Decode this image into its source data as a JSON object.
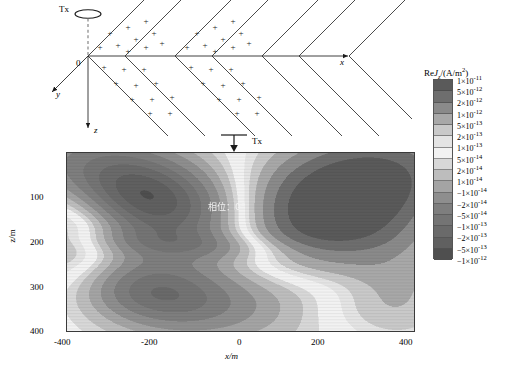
{
  "figure": {
    "schematic": {
      "tx_label": "Tx",
      "origin_label": "0",
      "axis_x": "x",
      "axis_y": "y",
      "axis_z": "z",
      "charge_symbol": "+",
      "n_wavefronts": 4
    },
    "plot": {
      "tx_marker_label": "Tx",
      "annotation": "相位：0°",
      "xlabel": "x/m",
      "ylabel": "z/m",
      "xticks": [
        "-400",
        "-200",
        "0",
        "200",
        "400"
      ],
      "yticks": [
        "100",
        "200",
        "300",
        "400"
      ]
    },
    "colorbar": {
      "title_prefix": "Re",
      "title_symbol": "J",
      "title_sub": "z",
      "title_units": "/(A/m",
      "title_units_sup": "2",
      "title_units_end": ")",
      "labels": [
        {
          "mantissa": "1×10",
          "exp": "-11"
        },
        {
          "mantissa": "5×10",
          "exp": "-12"
        },
        {
          "mantissa": "2×10",
          "exp": "-12"
        },
        {
          "mantissa": "1×10",
          "exp": "-12"
        },
        {
          "mantissa": "5×10",
          "exp": "-13"
        },
        {
          "mantissa": "2×10",
          "exp": "-13"
        },
        {
          "mantissa": "1×10",
          "exp": "-13"
        },
        {
          "mantissa": "5×10",
          "exp": "-14"
        },
        {
          "mantissa": "2×10",
          "exp": "-14"
        },
        {
          "mantissa": "1×10",
          "exp": "-14"
        },
        {
          "mantissa": "−1×10",
          "exp": "-14"
        },
        {
          "mantissa": "−2×10",
          "exp": "-14"
        },
        {
          "mantissa": "−5×10",
          "exp": "-14"
        },
        {
          "mantissa": "−1×10",
          "exp": "-13"
        },
        {
          "mantissa": "−2×10",
          "exp": "-13"
        },
        {
          "mantissa": "−5×10",
          "exp": "-13"
        },
        {
          "mantissa": "−1×10",
          "exp": "-12"
        }
      ],
      "swatch_colors": [
        "#5a5a5a",
        "#6e6e6e",
        "#8a8a8a",
        "#a8a8a8",
        "#c9c9c9",
        "#e4e4e4",
        "#f2f2f2",
        "#d8d8d8",
        "#bdbdbd",
        "#a4a4a4",
        "#8e8e8e",
        "#7e7e7e",
        "#747474",
        "#6a6a6a",
        "#606060",
        "#4f4f4f"
      ]
    }
  },
  "chart_data": {
    "type": "heatmap",
    "title": "",
    "xlabel": "x/m",
    "ylabel": "z/m",
    "xlim": [
      -400,
      400
    ],
    "ylim": [
      0,
      400
    ],
    "yaxis_inverted": true,
    "grid": false,
    "legend": "colorbar-right",
    "colorbar_label": "ReJz/(A/m2)",
    "colorbar_scale": "discrete-signed-log",
    "levels": [
      1e-11,
      5e-12,
      2e-12,
      1e-12,
      5e-13,
      2e-13,
      1e-13,
      5e-14,
      2e-14,
      1e-14,
      -1e-14,
      -2e-14,
      -5e-14,
      -1e-13,
      -2e-13,
      -5e-13,
      -1e-12
    ],
    "annotations": [
      {
        "text": "相位：0°",
        "x": 130,
        "y": 115
      },
      {
        "text": "Tx",
        "x": 30,
        "y": -22
      }
    ],
    "features": [
      {
        "name": "upper-left-negative-lobe",
        "x_center": -230,
        "z_center": 95,
        "value": -5e-13
      },
      {
        "name": "upper-right-positive-lobe",
        "x_center": 215,
        "z_center": 120,
        "value": 1e-11
      },
      {
        "name": "lower-left-lobe",
        "x_center": -210,
        "z_center": 310,
        "value": -2e-13
      },
      {
        "name": "mid-band-low-amplitude",
        "x_center": -20,
        "z_center": 205,
        "value": 1e-13
      }
    ]
  }
}
